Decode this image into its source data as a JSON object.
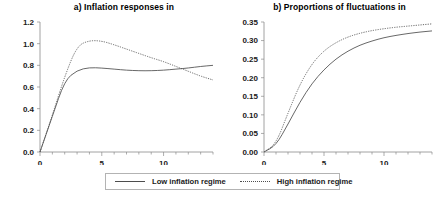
{
  "figure": {
    "legend": {
      "entries": [
        {
          "label": "Low inflation regime",
          "style": "solid",
          "swatch": "solid-line-swatch"
        },
        {
          "label": "High inflation regime",
          "style": "dotted",
          "swatch": "dotted-line-swatch"
        }
      ]
    }
  },
  "chart_data": [
    {
      "type": "line",
      "panel": "a",
      "title": "a) Inflation responses in",
      "xlabel": "",
      "ylabel": "",
      "xlim": [
        0,
        14
      ],
      "ylim": [
        0,
        1.2
      ],
      "yticks": [
        "0.0",
        "0.2",
        "0.4",
        "0.6",
        "0.8",
        "1.0",
        "1.2"
      ],
      "ytickvalues": [
        0.0,
        0.2,
        0.4,
        0.6,
        0.8,
        1.0,
        1.2
      ],
      "xticks": [
        "0",
        "5",
        "10"
      ],
      "xtickvalues": [
        0,
        5,
        10
      ],
      "xminortickstep": 1,
      "grid": false,
      "legend_position": "bottom",
      "x": [
        0,
        1,
        2,
        3,
        4,
        5,
        6,
        7,
        8,
        9,
        10,
        11,
        12,
        13,
        14
      ],
      "series": [
        {
          "name": "Low inflation regime",
          "style": "solid",
          "values": [
            0.0,
            0.33,
            0.66,
            0.755,
            0.78,
            0.775,
            0.765,
            0.755,
            0.75,
            0.75,
            0.755,
            0.765,
            0.775,
            0.79,
            0.8
          ]
        },
        {
          "name": "High inflation regime",
          "style": "dotted",
          "values": [
            0.0,
            0.34,
            0.7,
            0.98,
            1.03,
            1.025,
            0.99,
            0.95,
            0.91,
            0.87,
            0.835,
            0.79,
            0.745,
            0.7,
            0.665
          ]
        }
      ]
    },
    {
      "type": "line",
      "panel": "b",
      "title": "b)  Proportions of fluctuations in",
      "xlabel": "",
      "ylabel": "",
      "xlim": [
        0,
        14
      ],
      "ylim": [
        0,
        0.35
      ],
      "yticks": [
        "0.00",
        "0.05",
        "0.10",
        "0.15",
        "0.20",
        "0.25",
        "0.30",
        "0.35"
      ],
      "ytickvalues": [
        0.0,
        0.05,
        0.1,
        0.15,
        0.2,
        0.25,
        0.3,
        0.35
      ],
      "xticks": [
        "0",
        "5",
        "10"
      ],
      "xtickvalues": [
        0,
        5,
        10
      ],
      "xminortickstep": 1,
      "grid": false,
      "legend_position": "bottom",
      "x": [
        0,
        1,
        2,
        3,
        4,
        5,
        6,
        7,
        8,
        9,
        10,
        11,
        12,
        13,
        14
      ],
      "series": [
        {
          "name": "Low inflation regime",
          "style": "solid",
          "values": [
            0.0,
            0.018,
            0.075,
            0.135,
            0.185,
            0.222,
            0.251,
            0.272,
            0.288,
            0.299,
            0.308,
            0.314,
            0.319,
            0.323,
            0.326
          ]
        },
        {
          "name": "High inflation regime",
          "style": "dotted",
          "values": [
            0.0,
            0.022,
            0.105,
            0.183,
            0.238,
            0.273,
            0.295,
            0.31,
            0.32,
            0.327,
            0.332,
            0.336,
            0.339,
            0.342,
            0.345
          ]
        }
      ]
    }
  ]
}
